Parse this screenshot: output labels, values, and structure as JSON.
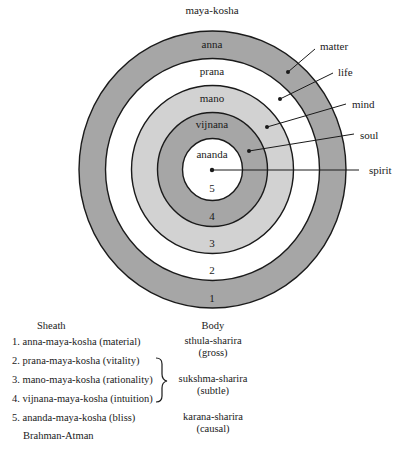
{
  "title": "maya-kosha",
  "colors": {
    "dark_ring": "#a6a6a6",
    "light_ring": "#d2d2d2",
    "white": "#ffffff",
    "stroke": "#1a1a1a"
  },
  "rings": [
    {
      "number": "1",
      "name": "anna",
      "fill": "dark"
    },
    {
      "number": "2",
      "name": "prana",
      "fill": "white"
    },
    {
      "number": "3",
      "name": "mano",
      "fill": "light"
    },
    {
      "number": "4",
      "name": "vijnana",
      "fill": "dark"
    },
    {
      "number": "5",
      "name": "ananda",
      "fill": "white"
    }
  ],
  "callouts": [
    "matter",
    "life",
    "mind",
    "soul",
    "spirit"
  ],
  "table": {
    "sheath_header": "Sheath",
    "body_header": "Body",
    "sheaths": [
      "1. anna-maya-kosha (material)",
      "2. prana-maya-kosha (vitality)",
      "3. mano-maya-kosha (rationality)",
      "4. vijnana-maya-kosha (intuition)",
      "5. ananda-maya-kosha (bliss)"
    ],
    "footer": "Brahman-Atman",
    "bodies": [
      {
        "name": "sthula-sharira",
        "gloss": "(gross)"
      },
      {
        "name": "sukshma-sharira",
        "gloss": "(subtle)"
      },
      {
        "name": "karana-sharira",
        "gloss": "(causal)"
      }
    ]
  }
}
